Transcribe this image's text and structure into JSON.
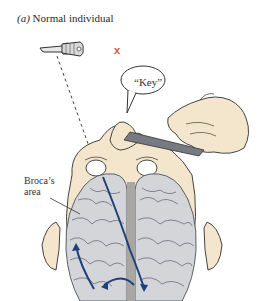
{
  "figure": {
    "panel_label": "(a)",
    "title": "Normal individual",
    "speech_bubble": "“Key”",
    "absent_marker": "x",
    "labels": {
      "broca_line1": "Broca’s",
      "broca_line2": "area"
    },
    "colors": {
      "skin": "#f3e6cc",
      "brain": "#d3d5d8",
      "brain_outline": "#5a6068",
      "pathway_arrows": "#1f3f7a",
      "x_mark": "#d9534f",
      "card": "#777a80",
      "midline": "#a9a7a2"
    },
    "icons": [
      "key-icon",
      "hand-icon",
      "card-icon",
      "speech-bubble-icon",
      "brain-icon",
      "arrow-icon"
    ]
  }
}
